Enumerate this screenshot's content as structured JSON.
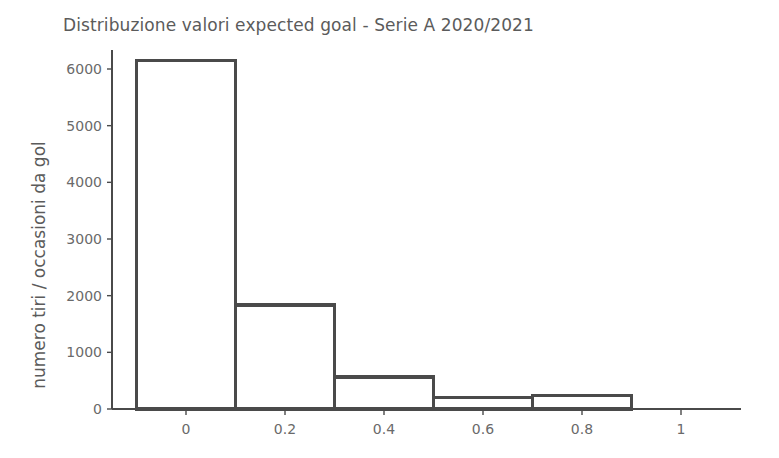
{
  "chart_data": {
    "type": "bar",
    "title": "Distribuzione valori expected goal - Serie A 2020/2021",
    "xlabel": "",
    "ylabel": "numero tiri / occasioni da gol",
    "grid": false,
    "legend": null,
    "xlim": [
      -0.12,
      1.12
    ],
    "ylim": [
      0,
      6400
    ],
    "xticks": [
      "0",
      "0.2",
      "0.4",
      "0.6",
      "0.8",
      "1"
    ],
    "xtick_values": [
      0,
      0.2,
      0.4,
      0.6,
      0.8,
      1
    ],
    "yticks": [
      "0",
      "1000",
      "2000",
      "3000",
      "4000",
      "5000",
      "6000"
    ],
    "ytick_values": [
      0,
      1000,
      2000,
      3000,
      4000,
      5000,
      6000
    ],
    "bin_edges": [
      -0.1,
      0.1,
      0.3,
      0.5,
      0.7,
      0.9
    ],
    "categories": [
      "-0.1 – 0.1",
      "0.1 – 0.3",
      "0.3 – 0.5",
      "0.5 – 0.7",
      "0.7 – 0.9"
    ],
    "values": [
      6150,
      1835,
      565,
      200,
      235
    ],
    "bar_fill": "#ffffff",
    "bar_stroke": "#4a4a4a",
    "axis_color": "#4a4a4a",
    "text_color": "#5b5b5b",
    "background": "#ffffff"
  }
}
